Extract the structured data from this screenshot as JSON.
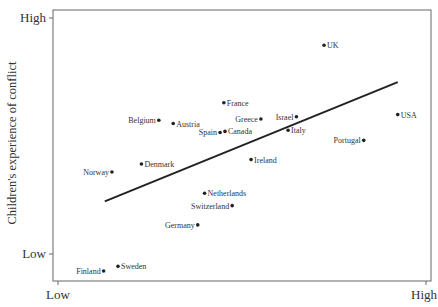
{
  "chart_data": {
    "type": "scatter",
    "title": "",
    "xlabel": "",
    "ylabel": "Children's experience of conflict",
    "x_ticks": [
      "Low",
      "High"
    ],
    "y_ticks": [
      "Low",
      "High"
    ],
    "xlim": [
      0,
      100
    ],
    "ylim": [
      0,
      100
    ],
    "grid": false,
    "legend": null,
    "points": [
      {
        "label": "UK",
        "x": 71.7,
        "y": 87.0,
        "label_side": "right"
      },
      {
        "label": "France",
        "x": 45.2,
        "y": 65.8,
        "label_side": "right"
      },
      {
        "label": "Belgium",
        "x": 28.0,
        "y": 59.3,
        "label_side": "left"
      },
      {
        "label": "Austria",
        "x": 31.8,
        "y": 58.1,
        "label_side": "right"
      },
      {
        "label": "Greece",
        "x": 55.0,
        "y": 59.8,
        "label_side": "left"
      },
      {
        "label": "Israel",
        "x": 64.4,
        "y": 60.6,
        "label_side": "left"
      },
      {
        "label": "Italy",
        "x": 62.2,
        "y": 55.6,
        "label_side": "right"
      },
      {
        "label": "Spain",
        "x": 44.2,
        "y": 54.8,
        "label_side": "left"
      },
      {
        "label": "Canada",
        "x": 45.5,
        "y": 55.2,
        "label_side": "right"
      },
      {
        "label": "USA",
        "x": 91.2,
        "y": 61.4,
        "label_side": "right"
      },
      {
        "label": "Portugal",
        "x": 82.2,
        "y": 51.9,
        "label_side": "left"
      },
      {
        "label": "Ireland",
        "x": 52.4,
        "y": 44.8,
        "label_side": "right"
      },
      {
        "label": "Denmark",
        "x": 23.4,
        "y": 43.2,
        "label_side": "right"
      },
      {
        "label": "Norway",
        "x": 15.6,
        "y": 40.2,
        "label_side": "left"
      },
      {
        "label": "Netherlands",
        "x": 40.1,
        "y": 32.4,
        "label_side": "right"
      },
      {
        "label": "Switzerland",
        "x": 47.4,
        "y": 27.8,
        "label_side": "left"
      },
      {
        "label": "Germany",
        "x": 38.3,
        "y": 20.7,
        "label_side": "left"
      },
      {
        "label": "Sweden",
        "x": 17.2,
        "y": 5.4,
        "label_side": "right"
      },
      {
        "label": "Finland",
        "x": 13.4,
        "y": 3.7,
        "label_side": "left"
      }
    ],
    "trend_line": {
      "x1": 13.7,
      "y1": 29.4,
      "x2": 91.2,
      "y2": 73.4
    }
  },
  "axes": {
    "y_high": "High",
    "y_low": "Low",
    "x_low": "Low",
    "x_high": "High",
    "ylabel": "Children's experience of conflict"
  }
}
